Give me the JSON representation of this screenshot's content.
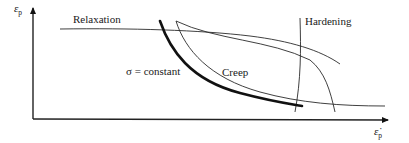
{
  "diagram": {
    "type": "strain vs strain-rate schematic",
    "axes": {
      "y_label": "ε",
      "y_subscript": "p",
      "x_label": "ε̇",
      "x_subscript": "p"
    },
    "curves": [
      {
        "id": "relaxation",
        "label": "Relaxation",
        "style": "thin"
      },
      {
        "id": "hardening",
        "label": "Hardening",
        "style": "thin"
      },
      {
        "id": "creep",
        "label": "Creep",
        "style": "thin"
      },
      {
        "id": "constant-stress",
        "label": "σ = constant",
        "style": "thick"
      },
      {
        "id": "transition",
        "label": "",
        "style": "thin"
      }
    ]
  }
}
